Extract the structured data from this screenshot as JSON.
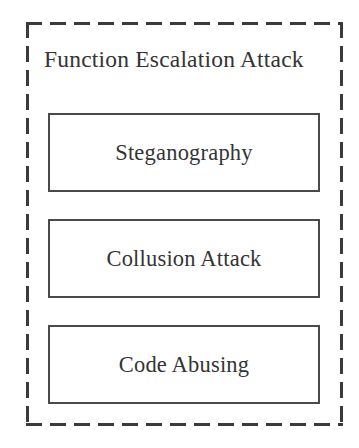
{
  "diagram": {
    "type": "block-grouping-diagram",
    "group": {
      "title": "Function Escalation Attack",
      "border_style": "dashed",
      "border_color": "#3a3a3a"
    },
    "nodes": [
      {
        "label": "Steganography",
        "border_color": "#4a4a4a",
        "fill": "#ffffff"
      },
      {
        "label": "Collusion Attack",
        "border_color": "#4a4a4a",
        "fill": "#ffffff"
      },
      {
        "label": "Code Abusing",
        "border_color": "#4a4a4a",
        "fill": "#ffffff"
      }
    ],
    "colors": {
      "background": "#ffffff",
      "text": "#343434",
      "group_stroke": "#3a3a3a",
      "node_stroke": "#4a4a4a"
    }
  }
}
